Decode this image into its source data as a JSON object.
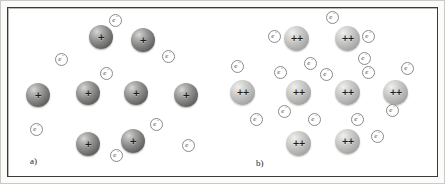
{
  "figure": {
    "width": 445,
    "height": 184,
    "background": "#ffffff",
    "frame_color": "#3a3a3a",
    "caption_font_style": "italic-serif"
  },
  "symbols": {
    "electron_label": "e",
    "electron_superscript": "−",
    "monovalent_charge": "+",
    "divalent_charge": "++"
  },
  "colors": {
    "monovalent_ion": "#6e6e6d",
    "divalent_ion": "#c4c4c2",
    "electron_outline": "#8a8a88",
    "electron_fill": "#ffffff",
    "frame": "#3a3a3a",
    "mat": "#fbfbfa"
  },
  "panels": [
    {
      "id": "a",
      "label": "a)",
      "label_x": 22,
      "label_y": 148,
      "description": "monovalent metal lattice",
      "ion_charge": "+",
      "ion_type": "mono",
      "ion_count": 8,
      "electron_count": 7,
      "ions": [
        {
          "x": 81,
          "y": 17
        },
        {
          "x": 123,
          "y": 20
        },
        {
          "x": 18,
          "y": 75
        },
        {
          "x": 68,
          "y": 73
        },
        {
          "x": 116,
          "y": 73
        },
        {
          "x": 166,
          "y": 75
        },
        {
          "x": 68,
          "y": 124
        },
        {
          "x": 113,
          "y": 121
        }
      ],
      "electrons": [
        {
          "x": 101,
          "y": 6
        },
        {
          "x": 154,
          "y": 42
        },
        {
          "x": 47,
          "y": 45
        },
        {
          "x": 92,
          "y": 59
        },
        {
          "x": 22,
          "y": 115
        },
        {
          "x": 142,
          "y": 110
        },
        {
          "x": 102,
          "y": 141
        },
        {
          "x": 174,
          "y": 131
        }
      ]
    },
    {
      "id": "b",
      "label": "b)",
      "label_x": 33,
      "label_y": 150,
      "description": "divalent metal lattice",
      "ion_charge": "++",
      "ion_type": "di",
      "ion_count": 8,
      "electron_count": 16,
      "ions": [
        {
          "x": 61,
          "y": 18
        },
        {
          "x": 112,
          "y": 18
        },
        {
          "x": 7,
          "y": 72
        },
        {
          "x": 63,
          "y": 72
        },
        {
          "x": 112,
          "y": 72
        },
        {
          "x": 160,
          "y": 72
        },
        {
          "x": 63,
          "y": 123
        },
        {
          "x": 112,
          "y": 121
        }
      ],
      "electrons": [
        {
          "x": 45,
          "y": 22
        },
        {
          "x": 103,
          "y": 3
        },
        {
          "x": 139,
          "y": 22
        },
        {
          "x": 135,
          "y": 44
        },
        {
          "x": 8,
          "y": 52
        },
        {
          "x": 81,
          "y": 49
        },
        {
          "x": 51,
          "y": 58
        },
        {
          "x": 97,
          "y": 60
        },
        {
          "x": 139,
          "y": 58
        },
        {
          "x": 178,
          "y": 54
        },
        {
          "x": 55,
          "y": 97
        },
        {
          "x": 85,
          "y": 105
        },
        {
          "x": 27,
          "y": 105
        },
        {
          "x": 128,
          "y": 105
        },
        {
          "x": 163,
          "y": 96
        },
        {
          "x": 148,
          "y": 122
        }
      ]
    }
  ]
}
